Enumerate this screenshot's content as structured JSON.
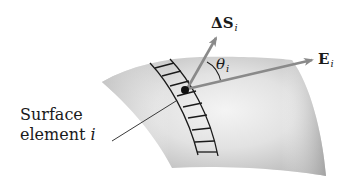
{
  "figure": {
    "labels": {
      "area_vector": {
        "symbol": "ΔS",
        "subscript": "i"
      },
      "field_vector": {
        "symbol": "E",
        "subscript": "i"
      },
      "angle": {
        "symbol": "θ",
        "subscript": "i"
      },
      "surface_element": {
        "line1": "Surface",
        "line2": "element",
        "index": "i"
      }
    },
    "colors": {
      "surface_dark": "#b5b5b5",
      "surface_light": "#f2f2f2",
      "arrow": "#8a8a8a",
      "ink": "#1a1a1a",
      "background": "#ffffff"
    }
  }
}
